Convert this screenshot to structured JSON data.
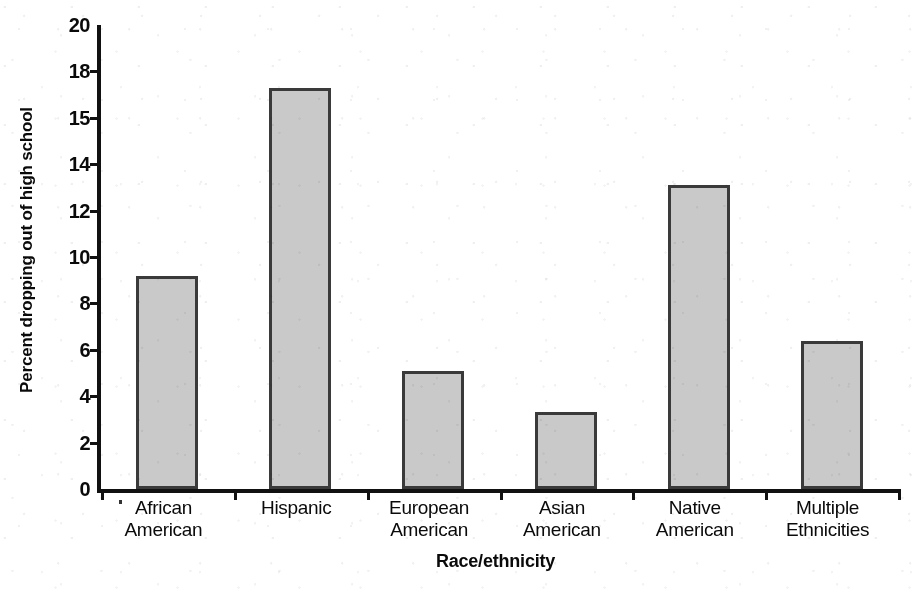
{
  "chart_data": {
    "type": "bar",
    "title": "",
    "xlabel": "Race/ethnicity",
    "ylabel": "Percent dropping out of high school",
    "categories": [
      "African American",
      "Hispanic",
      "European American",
      "Asian American",
      "Native American",
      "Multiple Ethnicities"
    ],
    "category_lines": [
      [
        "African",
        "American"
      ],
      [
        "Hispanic",
        ""
      ],
      [
        "European",
        "American"
      ],
      [
        "Asian",
        "American"
      ],
      [
        "Native",
        "American"
      ],
      [
        "Multiple",
        "Ethnicities"
      ]
    ],
    "values": [
      9.2,
      17.3,
      5.1,
      3.3,
      13.1,
      6.4
    ],
    "ylim": [
      0,
      20
    ],
    "ytick_labels": [
      "20",
      "18",
      "15",
      "14",
      "12",
      "10",
      "8",
      "6",
      "4",
      "2",
      "0"
    ],
    "ytick_positions": [
      20,
      18,
      16,
      14,
      12,
      10,
      8,
      6,
      4,
      2,
      0
    ],
    "grid": false,
    "legend": null,
    "bar_fill_color": "#c9c9c9",
    "bar_edge_color": "#3a3a3a",
    "axis_color": "#111111",
    "background_color": "#ffffff"
  }
}
